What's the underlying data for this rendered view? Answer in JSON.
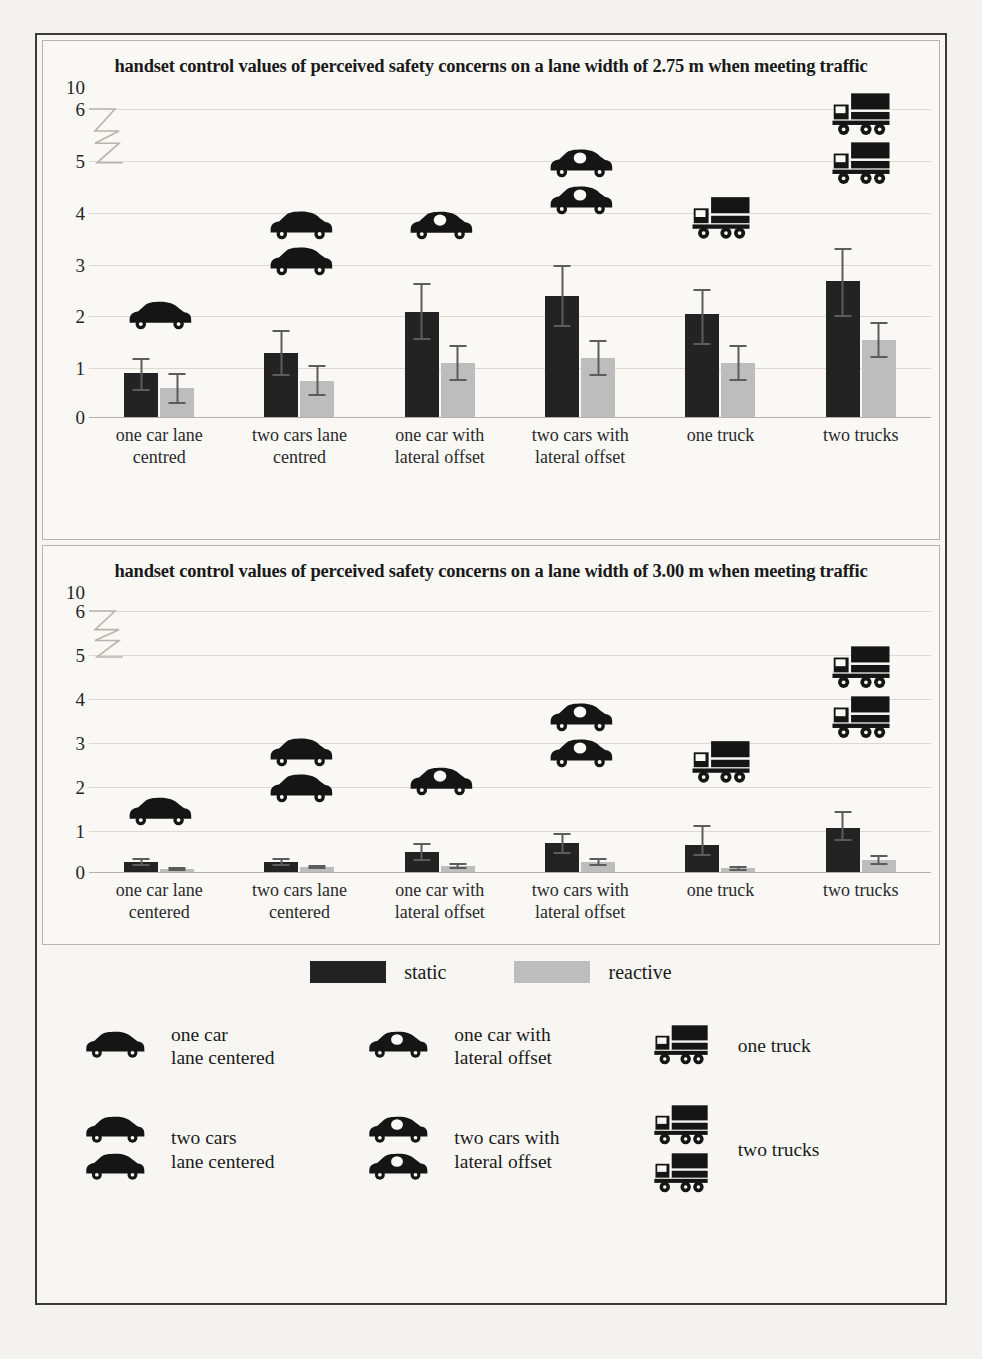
{
  "chart_data": [
    {
      "type": "bar",
      "title": "handset control values of perceived safety concerns on a lane width of 2.75 m when meeting traffic",
      "xlabel": "",
      "ylabel": "",
      "ylim": [
        0,
        6
      ],
      "yticks": [
        "10",
        "6",
        "5",
        "4",
        "3",
        "2",
        "1",
        "0"
      ],
      "axis_break": true,
      "grid": true,
      "legend_position": "bottom",
      "categories": [
        "one car lane centred",
        "two cars lane centred",
        "one car with lateral offset",
        "two cars with lateral offset",
        "one truck",
        "two trucks"
      ],
      "series": [
        {
          "name": "static",
          "color": "#232323",
          "values": [
            0.85,
            1.25,
            2.05,
            2.35,
            2.0,
            2.65
          ],
          "error_low": [
            0.35,
            0.45,
            0.55,
            0.6,
            0.6,
            0.7
          ],
          "error_high": [
            0.3,
            0.45,
            0.55,
            0.6,
            0.5,
            0.65
          ]
        },
        {
          "name": "reactive",
          "color": "#bdbdbd",
          "values": [
            0.55,
            0.7,
            1.05,
            1.15,
            1.05,
            1.5
          ],
          "error_low": [
            0.3,
            0.3,
            0.35,
            0.35,
            0.35,
            0.35
          ],
          "error_high": [
            0.3,
            0.3,
            0.35,
            0.35,
            0.35,
            0.35
          ]
        }
      ],
      "icon_annotations": [
        {
          "category": "one car lane centred",
          "icon": "car-icon",
          "count": 1,
          "variant": "plain",
          "y": 1.95
        },
        {
          "category": "two cars lane centred",
          "icon": "car-icon",
          "count": 2,
          "variant": "plain",
          "y": 3.35
        },
        {
          "category": "one car with lateral offset",
          "icon": "car-offset-icon",
          "count": 1,
          "variant": "offset",
          "y": 3.7
        },
        {
          "category": "two cars with lateral offset",
          "icon": "car-offset-icon",
          "count": 2,
          "variant": "offset",
          "y": 4.55
        },
        {
          "category": "one truck",
          "icon": "truck-icon",
          "count": 1,
          "variant": "plain",
          "y": 3.85
        },
        {
          "category": "two trucks",
          "icon": "truck-icon",
          "count": 2,
          "variant": "plain",
          "y": 5.4
        }
      ]
    },
    {
      "type": "bar",
      "title": "handset control values of perceived safety concerns on a lane width of 3.00 m when meeting traffic",
      "xlabel": "",
      "ylabel": "",
      "ylim": [
        0,
        6
      ],
      "yticks": [
        "10",
        "6",
        "5",
        "4",
        "3",
        "2",
        "1",
        "0"
      ],
      "axis_break": true,
      "grid": true,
      "legend_position": "bottom",
      "categories": [
        "one car lane centered",
        "two cars lane centered",
        "one car with lateral offset",
        "two cars with lateral offset",
        "one truck",
        "two trucks"
      ],
      "series": [
        {
          "name": "static",
          "color": "#232323",
          "values": [
            0.23,
            0.22,
            0.45,
            0.65,
            0.62,
            1.0
          ],
          "error_low": [
            0.1,
            0.1,
            0.2,
            0.25,
            0.25,
            0.3
          ],
          "error_high": [
            0.08,
            0.1,
            0.2,
            0.25,
            0.45,
            0.4
          ]
        },
        {
          "name": "reactive",
          "color": "#bdbdbd",
          "values": [
            0.06,
            0.1,
            0.13,
            0.22,
            0.08,
            0.27
          ],
          "error_low": [
            0.04,
            0.05,
            0.06,
            0.1,
            0.06,
            0.12
          ],
          "error_high": [
            0.04,
            0.05,
            0.06,
            0.1,
            0.06,
            0.12
          ]
        }
      ],
      "icon_annotations": [
        {
          "category": "one car lane centered",
          "icon": "car-icon",
          "count": 1,
          "variant": "plain",
          "y": 1.35
        },
        {
          "category": "two cars lane centered",
          "icon": "car-icon",
          "count": 2,
          "variant": "plain",
          "y": 2.3
        },
        {
          "category": "one car with lateral offset",
          "icon": "car-offset-icon",
          "count": 1,
          "variant": "offset",
          "y": 2.05
        },
        {
          "category": "two cars with lateral offset",
          "icon": "car-offset-icon",
          "count": 2,
          "variant": "offset",
          "y": 3.1
        },
        {
          "category": "one truck",
          "icon": "truck-icon",
          "count": 1,
          "variant": "plain",
          "y": 2.5
        },
        {
          "category": "two trucks",
          "icon": "truck-icon",
          "count": 2,
          "variant": "plain",
          "y": 4.1
        }
      ]
    }
  ],
  "legend": {
    "static_label": "static",
    "reactive_label": "reactive",
    "static_color": "#232323",
    "reactive_color": "#bdbdbd"
  },
  "icon_legend": [
    {
      "id": "one-car-lane-centered",
      "icon": "car-icon",
      "count": 1,
      "variant": "plain",
      "line1": "one car",
      "line2": "lane centered"
    },
    {
      "id": "one-car-with-lateral-offset",
      "icon": "car-offset-icon",
      "count": 1,
      "variant": "offset",
      "line1": "one car with",
      "line2": "lateral offset"
    },
    {
      "id": "one-truck",
      "icon": "truck-icon",
      "count": 1,
      "variant": "plain",
      "line1": "one truck",
      "line2": ""
    },
    {
      "id": "two-cars-lane-centered",
      "icon": "car-icon",
      "count": 2,
      "variant": "plain",
      "line1": "two cars",
      "line2": "lane centered"
    },
    {
      "id": "two-cars-with-lateral-offset",
      "icon": "car-offset-icon",
      "count": 2,
      "variant": "offset",
      "line1": "two cars with",
      "line2": "lateral offset"
    },
    {
      "id": "two-trucks",
      "icon": "truck-icon",
      "count": 2,
      "variant": "plain",
      "line1": "two trucks",
      "line2": ""
    }
  ],
  "bleed_text": [
    {
      "t": "Table",
      "x": 700,
      "y": 120,
      "s": 15
    },
    {
      "t": "the values for",
      "x": 620,
      "y": 168,
      "s": 16
    },
    {
      "t": "10.121",
      "x": 430,
      "y": 205,
      "s": 16
    },
    {
      "t": "position of oncoming",
      "x": 505,
      "y": 248,
      "s": 17
    },
    {
      "t": "vehicles",
      "x": 440,
      "y": 260,
      "s": 16
    },
    {
      "t": "speed of oncoming",
      "x": 500,
      "y": 312,
      "s": 17
    },
    {
      "t": "vehicles",
      "x": 430,
      "y": 330,
      "s": 16
    },
    {
      "t": "lane width x type",
      "x": 560,
      "y": 378,
      "s": 16
    },
    {
      "t": "5.755",
      "x": 560,
      "y": 545,
      "s": 16
    },
    {
      "t": "lane width x type",
      "x": 200,
      "y": 566,
      "s": 16
    },
    {
      "t": "position x quantity x spd",
      "x": 330,
      "y": 710,
      "s": 17
    },
    {
      "t": "lane width x quantity x spd",
      "x": 300,
      "y": 740,
      "s": 17
    },
    {
      "t": "type x lane width",
      "x": 400,
      "y": 775,
      "s": 16
    },
    {
      "t": "The model for perceived safety concerns",
      "x": 200,
      "y": 890,
      "s": 18
    },
    {
      "t": "handset control",
      "x": 150,
      "y": 915,
      "s": 17
    },
    {
      "t": "0.000, p < 0.05 indicates a significant",
      "x": 140,
      "y": 975,
      "s": 18
    },
    {
      "t": "Perceived safety concerns are affected",
      "x": 150,
      "y": 1110,
      "s": 18
    },
    {
      "t": "position of oncoming vehicles",
      "x": 300,
      "y": 1145,
      "s": 17
    }
  ]
}
